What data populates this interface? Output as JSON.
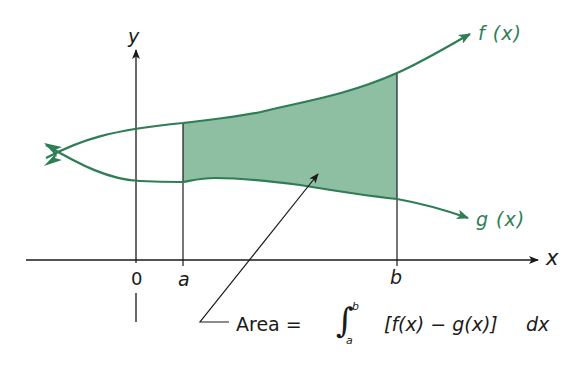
{
  "diagram": {
    "type": "area-between-curves",
    "colors": {
      "curve": "#2e7d55",
      "fill": "#8fbfa3",
      "axis": "#1a1a1a",
      "text": "#1a1a1a",
      "curve_label": "#2e7d55"
    },
    "axes": {
      "x_label": "x",
      "y_label": "y",
      "origin_label": "0"
    },
    "bounds": {
      "lower_label": "a",
      "upper_label": "b"
    },
    "curves": [
      {
        "name": "f",
        "label": "f (x)"
      },
      {
        "name": "g",
        "label": "g (x)"
      }
    ],
    "formula": {
      "prefix": "Area =",
      "integral_sign": "∫",
      "upper_limit": "b",
      "lower_limit": "a",
      "integrand": "[f(x) − g(x)]",
      "differential": "dx"
    }
  }
}
